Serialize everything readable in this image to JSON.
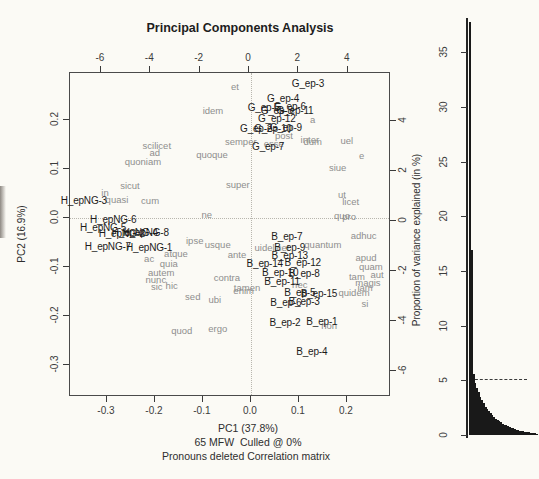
{
  "colors": {
    "background": "#fbfaf5",
    "sample_label": "#1b1b1b",
    "word_label": "#8e8e8e",
    "bar_fill": "#191919",
    "axis": "#3a3a3a"
  },
  "chart_data": [
    {
      "type": "scatter",
      "title": "Principal Components Analysis",
      "xlabel": "PC1 (37.8%)",
      "ylabel": "PC2 (16.9%)",
      "subtitle1": "65 MFW  Culled @ 0%",
      "subtitle2": "Pronouns deleted Correlation matrix",
      "xlim": [
        -0.377,
        0.292
      ],
      "ylim": [
        -0.365,
        0.296
      ],
      "top_xlim": [
        -7.25,
        5.75
      ],
      "right_ylim": [
        -7.04,
        5.92
      ],
      "xticks": [
        [
          -0.3,
          "-0.3"
        ],
        [
          -0.2,
          "-0.2"
        ],
        [
          -0.1,
          "-0.1"
        ],
        [
          0,
          "0.0"
        ],
        [
          0.1,
          "0.1"
        ],
        [
          0.2,
          "0.2"
        ]
      ],
      "yticks": [
        [
          0.2,
          "0.2"
        ],
        [
          0.1,
          "0.1"
        ],
        [
          0,
          "0.0"
        ],
        [
          -0.1,
          "-0.1"
        ],
        [
          -0.2,
          "-0.2"
        ],
        [
          -0.3,
          "-0.3"
        ]
      ],
      "top_xticks": [
        [
          -6,
          "-6"
        ],
        [
          -4,
          "-4"
        ],
        [
          -2,
          "-2"
        ],
        [
          0,
          "0"
        ],
        [
          2,
          "2"
        ],
        [
          4,
          "4"
        ]
      ],
      "right_yticks": [
        [
          4,
          "4"
        ],
        [
          2,
          "2"
        ],
        [
          0,
          "0"
        ],
        [
          -2,
          "-2"
        ],
        [
          -4,
          "-4"
        ],
        [
          -6,
          "-6"
        ]
      ],
      "samples": [
        {
          "label": "G_ep-3",
          "x": 0.121,
          "y": 0.271
        },
        {
          "label": "G_ep-4",
          "x": 0.069,
          "y": 0.241
        },
        {
          "label": "G_ep-5",
          "x": 0.029,
          "y": 0.222
        },
        {
          "label": "G_ep-6",
          "x": 0.083,
          "y": 0.224
        },
        {
          "label": "G_ep-8",
          "x": 0.056,
          "y": 0.216
        },
        {
          "label": "G_ep-11",
          "x": 0.094,
          "y": 0.216
        },
        {
          "label": "G_ep-12",
          "x": 0.056,
          "y": 0.2
        },
        {
          "label": "G_ep-2",
          "x": 0.013,
          "y": 0.18
        },
        {
          "label": "G_ep-10",
          "x": 0.048,
          "y": 0.18
        },
        {
          "label": "G_ep-9",
          "x": 0.075,
          "y": 0.182
        },
        {
          "label": "G_ep-7",
          "x": 0.038,
          "y": 0.143
        },
        {
          "label": "H_epNG-3",
          "x": -0.346,
          "y": 0.033
        },
        {
          "label": "H_epNG-6",
          "x": -0.285,
          "y": -0.006
        },
        {
          "label": "H_epNG-5",
          "x": -0.306,
          "y": -0.022
        },
        {
          "label": "H_epNG-4",
          "x": -0.24,
          "y": -0.033
        },
        {
          "label": "H_epNG-2",
          "x": -0.267,
          "y": -0.035
        },
        {
          "label": "H_epNG-8",
          "x": -0.217,
          "y": -0.033
        },
        {
          "label": "H_epNG-7",
          "x": -0.296,
          "y": -0.061
        },
        {
          "label": "H_epNG-1",
          "x": -0.21,
          "y": -0.063
        },
        {
          "label": "B_ep-7",
          "x": 0.077,
          "y": -0.041
        },
        {
          "label": "B_ep-9",
          "x": 0.083,
          "y": -0.063
        },
        {
          "label": "B_ep-13",
          "x": 0.083,
          "y": -0.08
        },
        {
          "label": "B_ep-14",
          "x": 0.031,
          "y": -0.096
        },
        {
          "label": "B_ep-12",
          "x": 0.11,
          "y": -0.094
        },
        {
          "label": "B_ep-10",
          "x": 0.063,
          "y": -0.114
        },
        {
          "label": "B_ep-8",
          "x": 0.113,
          "y": -0.116
        },
        {
          "label": "B_ep-11",
          "x": 0.067,
          "y": -0.133
        },
        {
          "label": "B_ep-5",
          "x": 0.104,
          "y": -0.155
        },
        {
          "label": "B_ep-15",
          "x": 0.144,
          "y": -0.157
        },
        {
          "label": "B_ep-6",
          "x": 0.075,
          "y": -0.176
        },
        {
          "label": "B_ep-3",
          "x": 0.113,
          "y": -0.173
        },
        {
          "label": "B_ep-2",
          "x": 0.073,
          "y": -0.216
        },
        {
          "label": "B_ep-1",
          "x": 0.15,
          "y": -0.214
        },
        {
          "label": "B_ep-4",
          "x": 0.129,
          "y": -0.276
        }
      ],
      "words": [
        {
          "label": "et",
          "x": -0.031,
          "y": 0.265
        },
        {
          "label": "idem",
          "x": -0.077,
          "y": 0.216
        },
        {
          "label": "a",
          "x": 0.131,
          "y": 0.198
        },
        {
          "label": "semper",
          "x": -0.019,
          "y": 0.153
        },
        {
          "label": "esse",
          "x": 0.05,
          "y": 0.149
        },
        {
          "label": "post",
          "x": 0.071,
          "y": 0.165
        },
        {
          "label": "inter",
          "x": 0.125,
          "y": 0.157
        },
        {
          "label": "dum",
          "x": 0.131,
          "y": 0.153
        },
        {
          "label": "uel",
          "x": 0.202,
          "y": 0.155
        },
        {
          "label": "e",
          "x": 0.233,
          "y": 0.124
        },
        {
          "label": "siue",
          "x": 0.183,
          "y": 0.1
        },
        {
          "label": "scilicet",
          "x": -0.194,
          "y": 0.145
        },
        {
          "label": "ad",
          "x": -0.198,
          "y": 0.131
        },
        {
          "label": "quoniam",
          "x": -0.223,
          "y": 0.112
        },
        {
          "label": "quoque",
          "x": -0.079,
          "y": 0.127
        },
        {
          "label": "sicut",
          "x": -0.25,
          "y": 0.063
        },
        {
          "label": "in",
          "x": -0.302,
          "y": 0.049
        },
        {
          "label": "quasi",
          "x": -0.277,
          "y": 0.035
        },
        {
          "label": "cum",
          "x": -0.208,
          "y": 0.033
        },
        {
          "label": "super",
          "x": -0.025,
          "y": 0.065
        },
        {
          "label": "ne",
          "x": -0.09,
          "y": 0.004
        },
        {
          "label": "ut",
          "x": 0.192,
          "y": 0.045
        },
        {
          "label": "licet",
          "x": 0.21,
          "y": 0.031
        },
        {
          "label": "quo",
          "x": 0.192,
          "y": 0.002
        },
        {
          "label": "pro",
          "x": 0.207,
          "y": 0.0
        },
        {
          "label": "ipse",
          "x": -0.115,
          "y": -0.049
        },
        {
          "label": "usque",
          "x": -0.067,
          "y": -0.057
        },
        {
          "label": "ante",
          "x": -0.027,
          "y": -0.078
        },
        {
          "label": "atque",
          "x": -0.154,
          "y": -0.076
        },
        {
          "label": "ac",
          "x": -0.21,
          "y": -0.086
        },
        {
          "label": "quia",
          "x": -0.169,
          "y": -0.096
        },
        {
          "label": "autem",
          "x": -0.185,
          "y": -0.114
        },
        {
          "label": "nunc",
          "x": -0.196,
          "y": -0.129
        },
        {
          "label": "sic",
          "x": -0.194,
          "y": -0.143
        },
        {
          "label": "hic",
          "x": -0.163,
          "y": -0.141
        },
        {
          "label": "sed",
          "x": -0.119,
          "y": -0.163
        },
        {
          "label": "ubi",
          "x": -0.073,
          "y": -0.169
        },
        {
          "label": "quod",
          "x": -0.142,
          "y": -0.233
        },
        {
          "label": "ergo",
          "x": -0.067,
          "y": -0.229
        },
        {
          "label": "contra",
          "x": -0.048,
          "y": -0.124
        },
        {
          "label": "tamen",
          "x": -0.006,
          "y": -0.145
        },
        {
          "label": "enim",
          "x": -0.013,
          "y": -0.151
        },
        {
          "label": "adhuc",
          "x": 0.237,
          "y": -0.039
        },
        {
          "label": "quantum",
          "x": 0.152,
          "y": -0.057
        },
        {
          "label": "uidelicet",
          "x": 0.046,
          "y": -0.063
        },
        {
          "label": "apud",
          "x": 0.242,
          "y": -0.084
        },
        {
          "label": "quam",
          "x": 0.252,
          "y": -0.102
        },
        {
          "label": "aut",
          "x": 0.265,
          "y": -0.118
        },
        {
          "label": "tam",
          "x": 0.223,
          "y": -0.122
        },
        {
          "label": "magis",
          "x": 0.246,
          "y": -0.135
        },
        {
          "label": "iam",
          "x": 0.24,
          "y": -0.145
        },
        {
          "label": "quidem",
          "x": 0.217,
          "y": -0.155
        },
        {
          "label": "nec",
          "x": 0.104,
          "y": -0.139
        },
        {
          "label": "si",
          "x": 0.24,
          "y": -0.178
        },
        {
          "label": "non",
          "x": 0.165,
          "y": -0.222
        }
      ]
    },
    {
      "type": "bar",
      "ylabel": "Proportion of variance explained (in %)",
      "ylim": [
        0,
        38
      ],
      "yticks": [
        0,
        5,
        10,
        15,
        20,
        25,
        30,
        35
      ],
      "dashed_line_y": 5,
      "values": [
        37.8,
        16.9,
        5.6,
        4.8,
        4.3,
        3.9,
        3.5,
        3.2,
        2.9,
        2.6,
        2.4,
        2.2,
        2.0,
        1.8,
        1.65,
        1.5,
        1.38,
        1.26,
        1.15,
        1.05,
        0.96,
        0.88,
        0.8,
        0.73,
        0.66,
        0.6,
        0.55,
        0.5,
        0.45,
        0.41,
        0.37,
        0.33,
        0.3,
        0.27,
        0.24,
        0.21,
        0.19,
        0.17,
        0.15,
        0.13
      ]
    }
  ]
}
